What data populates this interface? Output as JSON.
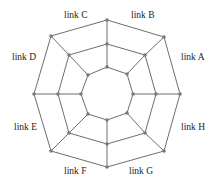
{
  "diagram": {
    "type": "concentric-octagon-network",
    "rings": 3,
    "colors": {
      "edge": "#6e6e6e",
      "node": "#7a7a7a",
      "label": "#222222",
      "background": "#ffffff"
    },
    "labels": [
      {
        "text": "link A",
        "x": 181,
        "y": 60
      },
      {
        "text": "link B",
        "x": 131,
        "y": 18
      },
      {
        "text": "link C",
        "x": 64,
        "y": 18
      },
      {
        "text": "link D",
        "x": 12,
        "y": 60
      },
      {
        "text": "link E",
        "x": 14,
        "y": 130
      },
      {
        "text": "link F",
        "x": 64,
        "y": 174
      },
      {
        "text": "link G",
        "x": 129,
        "y": 174
      },
      {
        "text": "link H",
        "x": 181,
        "y": 130
      }
    ],
    "rings_points": {
      "outer": [
        [
          107,
          20
        ],
        [
          164,
          37
        ],
        [
          180,
          94
        ],
        [
          164,
          151
        ],
        [
          107,
          167
        ],
        [
          51,
          151
        ],
        [
          34,
          94
        ],
        [
          51,
          36
        ]
      ],
      "middle": [
        [
          107,
          44
        ],
        [
          145,
          55
        ],
        [
          156,
          94
        ],
        [
          145,
          133
        ],
        [
          107,
          144
        ],
        [
          69,
          133
        ],
        [
          58,
          94
        ],
        [
          69,
          55
        ]
      ],
      "inner": [
        [
          107,
          67
        ],
        [
          127,
          74
        ],
        [
          133,
          94
        ],
        [
          127,
          113
        ],
        [
          107,
          120
        ],
        [
          88,
          114
        ],
        [
          81,
          94
        ],
        [
          88,
          75
        ]
      ]
    }
  }
}
